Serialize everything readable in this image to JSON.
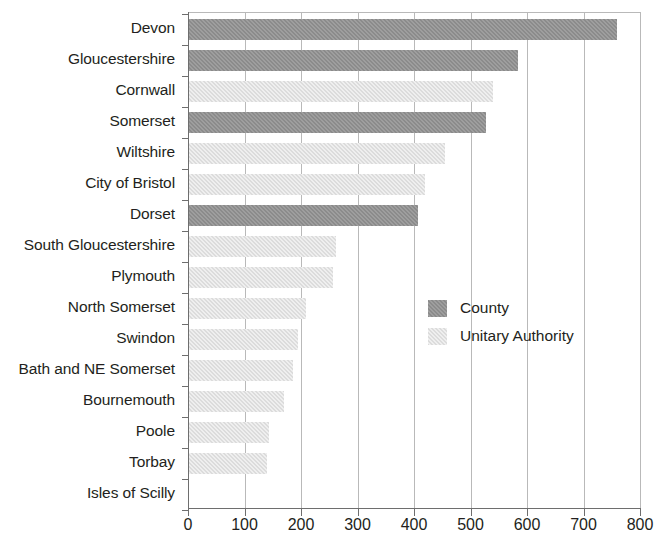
{
  "chart_data": {
    "type": "bar",
    "orientation": "horizontal",
    "title": "",
    "subtitle": "",
    "xlabel": "",
    "ylabel": "",
    "xlim": [
      0,
      800
    ],
    "ylim": null,
    "grid": true,
    "grid_axis": "x",
    "legend_position": "center-right",
    "xticks": [
      "0",
      "100",
      "200",
      "300",
      "400",
      "500",
      "600",
      "700",
      "800"
    ],
    "xtick_values": [
      0,
      100,
      200,
      300,
      400,
      500,
      600,
      700,
      800
    ],
    "categories": [
      "Devon",
      "Gloucestershire",
      "Cornwall",
      "Somerset",
      "Wiltshire",
      "City of Bristol",
      "Dorset",
      "South Gloucestershire",
      "Plymouth",
      "North Somerset",
      "Swindon",
      "Bath and NE Somerset",
      "Bournemouth",
      "Poole",
      "Torbay",
      "Isles of Scilly"
    ],
    "values": [
      760,
      584,
      540,
      527,
      455,
      420,
      407,
      262,
      256,
      208,
      194,
      185,
      170,
      144,
      139,
      0
    ],
    "group": [
      "County",
      "County",
      "Unitary Authority",
      "County",
      "Unitary Authority",
      "Unitary Authority",
      "County",
      "Unitary Authority",
      "Unitary Authority",
      "Unitary Authority",
      "Unitary Authority",
      "Unitary Authority",
      "Unitary Authority",
      "Unitary Authority",
      "Unitary Authority",
      "Unitary Authority"
    ],
    "series": [
      {
        "name": "County",
        "color": "#8b8b8b",
        "points": [
          {
            "category": "Devon",
            "value": 760
          },
          {
            "category": "Gloucestershire",
            "value": 584
          },
          {
            "category": "Somerset",
            "value": 527
          },
          {
            "category": "Dorset",
            "value": 407
          }
        ]
      },
      {
        "name": "Unitary Authority",
        "color": "#dcdcdc",
        "points": [
          {
            "category": "Cornwall",
            "value": 540
          },
          {
            "category": "Wiltshire",
            "value": 455
          },
          {
            "category": "City of Bristol",
            "value": 420
          },
          {
            "category": "South Gloucestershire",
            "value": 262
          },
          {
            "category": "Plymouth",
            "value": 256
          },
          {
            "category": "North Somerset",
            "value": 208
          },
          {
            "category": "Swindon",
            "value": 194
          },
          {
            "category": "Bath and NE Somerset",
            "value": 185
          },
          {
            "category": "Bournemouth",
            "value": 170
          },
          {
            "category": "Poole",
            "value": 144
          },
          {
            "category": "Torbay",
            "value": 139
          },
          {
            "category": "Isles of Scilly",
            "value": 0
          }
        ]
      }
    ]
  },
  "legend": {
    "entries": [
      {
        "label": "County",
        "color": "#8b8b8b",
        "key": "county"
      },
      {
        "label": "Unitary Authority",
        "color": "#dcdcdc",
        "key": "unitary"
      }
    ]
  },
  "colors": {
    "county": "#8b8b8b",
    "unitary": "#dcdcdc",
    "axis": "#6e6e6e",
    "grid": "#b9b9b9",
    "text": "#231f20",
    "background": "#ffffff"
  }
}
